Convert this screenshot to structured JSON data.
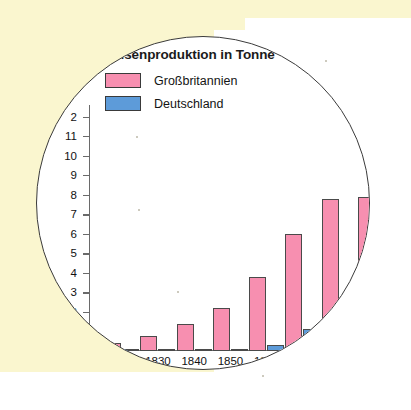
{
  "figure": {
    "background_color": "#FAF6CF",
    "lens_fill": "#FFFFFF",
    "lens_border_color": "#3B3B3B"
  },
  "chart_data": {
    "type": "bar",
    "title": "heisenproduktion in Tonne",
    "title_full_hint": "Roheisenproduktion in Tonnen",
    "xlabel": "",
    "ylabel": "",
    "grid": false,
    "legend_position": "top-left",
    "ylim": [
      0,
      12.6
    ],
    "yticks": [
      1,
      2,
      3,
      4,
      5,
      6,
      7,
      8,
      9,
      10,
      11,
      12
    ],
    "ytick_labels": [
      "",
      "2",
      "3",
      "4",
      "5",
      "6",
      "7",
      "8",
      "9",
      "10",
      "11",
      "2"
    ],
    "categories": [
      "1820",
      "1830",
      "1840",
      "1850",
      "1860",
      "1870",
      "1880",
      "1890"
    ],
    "xtick_labels": [
      "0",
      "1830",
      "1840",
      "1850",
      "1860",
      "1",
      "",
      ""
    ],
    "series": [
      {
        "name": "Großbritannien",
        "color": "#F78FB0",
        "values": [
          0.4,
          0.75,
          1.4,
          2.2,
          3.8,
          6.0,
          7.8,
          7.9
        ]
      },
      {
        "name": "Deutschland",
        "color": "#5D9BD9",
        "values": [
          0.05,
          0.07,
          0.1,
          0.12,
          0.3,
          1.15,
          2.3,
          0.0
        ]
      }
    ]
  },
  "legend": {
    "items": [
      {
        "label": "Großbritannien",
        "color": "#F78FB0"
      },
      {
        "label": "Deutschland",
        "color": "#5D9BD9"
      }
    ]
  }
}
